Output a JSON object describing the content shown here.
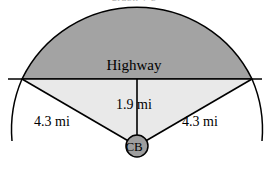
{
  "figure": {
    "title_clipped": "graph  y                 p",
    "labels": {
      "highway": "Highway",
      "height": "1.9 mi",
      "radius_left": "4.3 mi",
      "radius_right": "4.3 mi",
      "center_point": "CB"
    },
    "colors": {
      "upper_segment_fill": "#a3a3a3",
      "lower_sector_fill": "#e9e9e9",
      "stroke": "#000000",
      "cb_marker_fill": "#9e9e9e",
      "background": "#ffffff"
    },
    "geometry": {
      "center_x": 137,
      "center_y": 146,
      "radius_px": 128,
      "chord_y": 79,
      "chord_left_x": 22,
      "chord_right_x": 252,
      "highway_line_left_x": 8,
      "highway_line_right_x": 262,
      "arc_top_y": 13,
      "cb_marker_radius": 11
    },
    "measurements": {
      "radius_mi": 4.3,
      "apothem_mi": 1.9,
      "units": "mi"
    }
  }
}
